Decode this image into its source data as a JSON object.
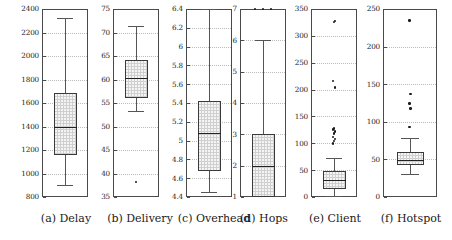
{
  "figure": {
    "kind": "boxplot-panel-grid",
    "panel_count": 6,
    "background_color": "#ffffff",
    "box_fill_color": "#cfcfcf",
    "line_color": "#3a3a3a",
    "grid_color": "#bcbcbc"
  },
  "captions": {
    "a": "(a) Delay",
    "b": "(b) Delivery",
    "c": "(c) Overhead",
    "d": "(d) Hops",
    "e": "(e) Client",
    "f": "(f) Hotspot"
  },
  "chart_data": [
    {
      "type": "box",
      "panel": "a",
      "title": "(a) Delay",
      "xlabel": "",
      "ylabel": "",
      "ylim": [
        800,
        2400
      ],
      "yticks": [
        800,
        1000,
        1200,
        1400,
        1600,
        1800,
        2000,
        2200,
        2400
      ],
      "ticklabels": [
        "800",
        "1000",
        "1200",
        "1400",
        "1600",
        "1800",
        "2000",
        "2200",
        "2400"
      ],
      "grid": true,
      "series": [
        {
          "name": "Delay",
          "q1": 1155,
          "median": 1395,
          "q3": 1685,
          "whisker_low": 900,
          "whisker_high": 2320,
          "outliers": []
        }
      ]
    },
    {
      "type": "box",
      "panel": "b",
      "title": "(b) Delivery",
      "xlabel": "",
      "ylabel": "",
      "ylim": [
        35,
        75
      ],
      "yticks": [
        35,
        40,
        45,
        50,
        55,
        60,
        65,
        70,
        75
      ],
      "ticklabels": [
        "35",
        "40",
        "45",
        "50",
        "55",
        "60",
        "65",
        "70",
        "75"
      ],
      "grid": true,
      "series": [
        {
          "name": "Delivery",
          "q1": 56.0,
          "median": 60.3,
          "q3": 64.1,
          "whisker_low": 53.3,
          "whisker_high": 71.4,
          "outliers": [
            38.2
          ]
        }
      ]
    },
    {
      "type": "box",
      "panel": "c",
      "title": "(c) Overhead",
      "xlabel": "",
      "ylabel": "",
      "ylim": [
        4.4,
        6.4
      ],
      "yticks": [
        4.4,
        4.6,
        4.8,
        5.0,
        5.2,
        5.4,
        5.6,
        5.8,
        6.0,
        6.2,
        6.4
      ],
      "ticklabels": [
        "4.4",
        "4.6",
        "4.8",
        "5",
        "5.2",
        "5.4",
        "5.6",
        "5.8",
        "6",
        "6.2",
        "6.4"
      ],
      "grid": true,
      "series": [
        {
          "name": "Overhead",
          "q1": 4.68,
          "median": 5.08,
          "q3": 5.42,
          "whisker_low": 4.45,
          "whisker_high": 6.4,
          "outliers": []
        }
      ]
    },
    {
      "type": "box",
      "panel": "d",
      "title": "(d) Hops",
      "xlabel": "",
      "ylabel": "",
      "ylim": [
        1,
        7
      ],
      "yticks": [
        1,
        2,
        3,
        4,
        5,
        6,
        7
      ],
      "ticklabels": [
        "1",
        "2",
        "3",
        "4",
        "5",
        "6",
        "7"
      ],
      "grid": true,
      "series": [
        {
          "name": "Hops",
          "q1": 1.0,
          "median": 2.0,
          "q3": 3.0,
          "whisker_low": 1.0,
          "whisker_high": 6.0,
          "outliers": [
            7,
            7,
            7
          ]
        }
      ]
    },
    {
      "type": "box",
      "panel": "e",
      "title": "(e) Client",
      "xlabel": "",
      "ylabel": "",
      "ylim": [
        0,
        350
      ],
      "yticks": [
        0,
        50,
        100,
        150,
        200,
        250,
        300,
        350
      ],
      "ticklabels": [
        "0",
        "50",
        "100",
        "150",
        "200",
        "250",
        "300",
        "350"
      ],
      "grid": true,
      "series": [
        {
          "name": "Client",
          "q1": 15,
          "median": 32,
          "q3": 48,
          "whisker_low": 2,
          "whisker_high": 72,
          "outliers": [
            100,
            104,
            108,
            112,
            118,
            122,
            126,
            128,
            204,
            216,
            326,
            328
          ]
        }
      ]
    },
    {
      "type": "box",
      "panel": "f",
      "title": "(f) Hotspot",
      "xlabel": "",
      "ylabel": "",
      "ylim": [
        0,
        250
      ],
      "yticks": [
        0,
        50,
        100,
        150,
        200,
        250
      ],
      "ticklabels": [
        "0",
        "50",
        "100",
        "150",
        "200",
        "250"
      ],
      "grid": true,
      "series": [
        {
          "name": "Hotspot",
          "q1": 43,
          "median": 49,
          "q3": 60,
          "whisker_low": 30,
          "whisker_high": 78,
          "outliers": [
            93,
            118,
            124,
            137,
            235
          ]
        }
      ]
    }
  ]
}
